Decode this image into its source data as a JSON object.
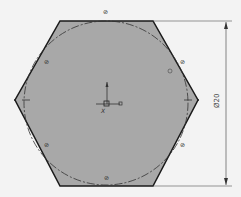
{
  "drawing": {
    "shape": "hexagon-circumscribed-circle",
    "fill_color": "#a9a9a9",
    "edge_color": "#1a1a1a",
    "background": "#f3f3f3",
    "dimension": {
      "label": "Ø20",
      "orientation": "vertical"
    },
    "relation_markers": [
      "⊘",
      "⊘",
      "⊘",
      "⊘",
      "⊘",
      "⊘"
    ],
    "origin_axis_label": "X"
  }
}
